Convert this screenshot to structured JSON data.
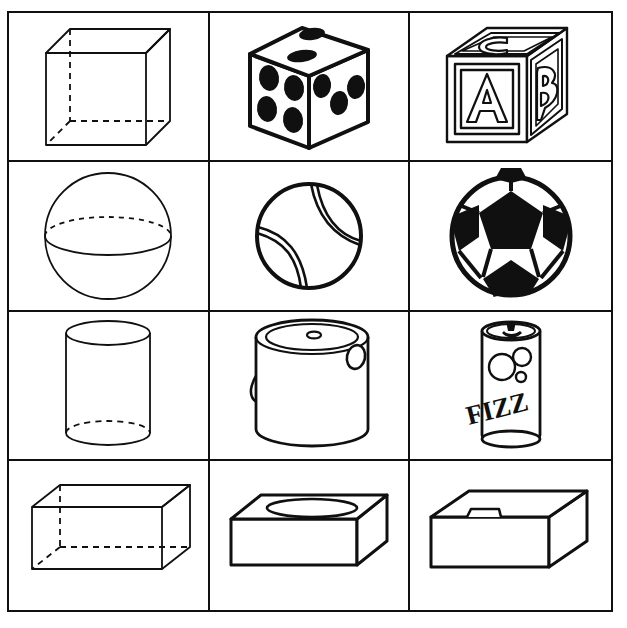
{
  "worksheet": {
    "title": "Geometric Solids and Real-World Objects",
    "grid": {
      "columns": 3,
      "rows": 4
    },
    "frame_color": "#101010",
    "background_color": "#ffffff",
    "line_color": "#101010"
  },
  "cells": [
    {
      "id": "cube-wireframe",
      "row": 1,
      "col": 1,
      "shape": "cube",
      "label": "Cube",
      "style": "wireframe with dashed hidden edges"
    },
    {
      "id": "dice",
      "row": 1,
      "col": 2,
      "shape": "cube",
      "label": "Dice",
      "style": "solid object, black pips",
      "faces": {
        "left_pips": 4,
        "right_pips": 3,
        "top_pips": 2
      }
    },
    {
      "id": "alphabet-block",
      "row": 1,
      "col": 3,
      "shape": "cube",
      "label": "Alphabet Block",
      "style": "outlined letters in panels",
      "letters": {
        "front": "A",
        "right": "B",
        "top": "C"
      }
    },
    {
      "id": "sphere-wireframe",
      "row": 2,
      "col": 1,
      "shape": "sphere",
      "label": "Sphere",
      "style": "circle with dashed equator"
    },
    {
      "id": "tennis-ball",
      "row": 2,
      "col": 2,
      "shape": "sphere",
      "label": "Tennis Ball",
      "style": "circle with two curved seams"
    },
    {
      "id": "soccer-ball",
      "row": 2,
      "col": 3,
      "shape": "sphere",
      "label": "Soccer Ball",
      "style": "black pentagons and white hexagons"
    },
    {
      "id": "cylinder-wireframe",
      "row": 3,
      "col": 1,
      "shape": "cylinder",
      "label": "Cylinder",
      "style": "wireframe with dashed hidden base"
    },
    {
      "id": "paint-can",
      "row": 3,
      "col": 2,
      "shape": "cylinder",
      "label": "Paint Can",
      "style": "can with lid and swing handle"
    },
    {
      "id": "soda-can",
      "row": 3,
      "col": 3,
      "shape": "cylinder",
      "label": "Soda Can",
      "style": "can with pull tab, bubbles and label",
      "brand_text": "FIZZ"
    },
    {
      "id": "prism-wireframe",
      "row": 4,
      "col": 1,
      "shape": "rectangular-prism",
      "label": "Rectangular Prism",
      "style": "wireframe with dashed hidden edges"
    },
    {
      "id": "tissue-box",
      "row": 4,
      "col": 2,
      "shape": "rectangular-prism",
      "label": "Tissue Box",
      "style": "flat box with oval opening on top"
    },
    {
      "id": "gift-box",
      "row": 4,
      "col": 3,
      "shape": "rectangular-prism",
      "label": "Box with Lid",
      "style": "shallow box with lid and handle notch"
    }
  ]
}
